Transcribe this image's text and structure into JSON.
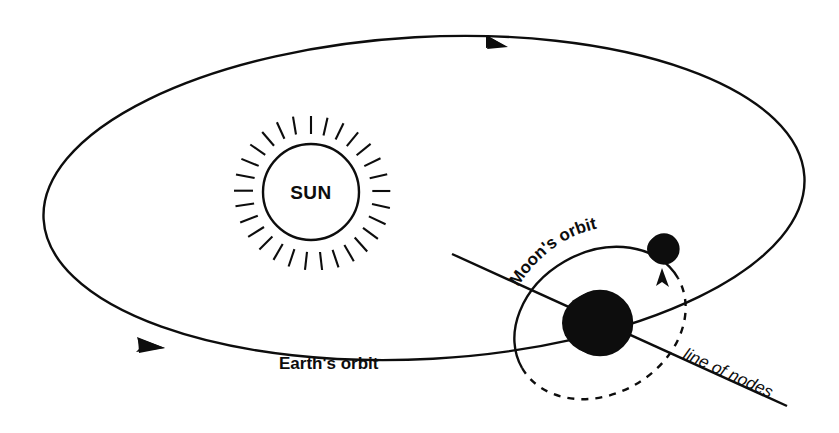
{
  "diagram": {
    "background_color": "#ffffff",
    "ink_color": "#0d0d0d",
    "width": 839,
    "height": 433,
    "labels": {
      "sun": "SUN",
      "earth_orbit": "Earth's orbit",
      "moon_orbit": "Moon's orbit",
      "line_of_nodes": "line of nodes"
    },
    "bodies": [
      {
        "name": "sun",
        "label": "SUN",
        "cx": 311,
        "cy": 190,
        "r": 48,
        "ray_count": 28,
        "ray_inner": 56,
        "ray_outer": 74,
        "shading": "none"
      },
      {
        "name": "earth",
        "label": "",
        "cx": 600,
        "cy": 323,
        "r": 33,
        "shading": "night-side-right-black"
      },
      {
        "name": "moon",
        "label": "",
        "cx": 664,
        "cy": 249,
        "r": 15,
        "shading": "night-side-right-black"
      }
    ],
    "orbits": [
      {
        "name": "earth-orbit",
        "style": "solid",
        "shape": "ellipse",
        "cx": 424,
        "cy": 198,
        "rx": 381,
        "ry": 165,
        "rotation_deg": -4,
        "arrow_direction": "counterclockwise",
        "arrows": [
          {
            "at": "top",
            "points": "left",
            "x": 470,
            "y": 41
          },
          {
            "at": "bottom-left",
            "points": "right",
            "x": 148,
            "y": 346
          }
        ]
      },
      {
        "name": "moon-orbit",
        "style": "half-solid-half-dashed",
        "shape": "ellipse",
        "cx": 600,
        "cy": 323,
        "rx": 90,
        "ry": 71,
        "rotation_deg": -32,
        "dash_pattern": "7 7",
        "arrow_direction": "counterclockwise-from-front",
        "arrows": [
          {
            "at": "right",
            "points": "up",
            "x": 663,
            "y": 277
          }
        ]
      }
    ],
    "lines": [
      {
        "name": "line-of-nodes",
        "style": "solid",
        "x1": 452,
        "y1": 254,
        "x2": 787,
        "y2": 406,
        "label": "line of nodes",
        "label_italic": true
      }
    ]
  }
}
